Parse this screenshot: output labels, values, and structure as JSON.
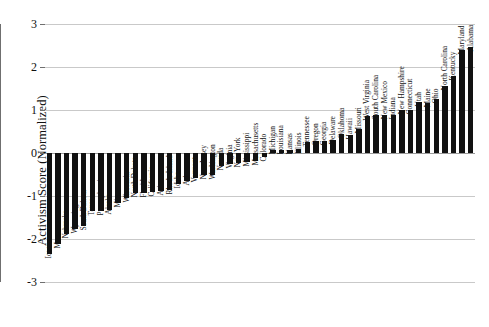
{
  "chart_data": {
    "type": "bar",
    "title": "",
    "subtitle": "",
    "xlabel": "",
    "ylabel": "Activism Score (Normalized)",
    "ylim": [
      -3,
      3
    ],
    "yticks": [
      3,
      2,
      1,
      0,
      -1,
      -2,
      -3
    ],
    "ytick_labels": [
      "3",
      "2",
      "1",
      "0",
      "-1",
      "-2",
      "-3"
    ],
    "grid": true,
    "legend": "none",
    "bar_color": "#111111",
    "orientation": "vertical",
    "sorted": "ascending",
    "categories": [
      "Iowa",
      "Montana",
      "Nebraska",
      "Wyoming",
      "South Dakota",
      "Texas",
      "Pennsylvania",
      "Alaska",
      "Minnesota",
      "Wisconsin",
      "North Dakota",
      "Florida",
      "California",
      "Arizona",
      "Rhode Island",
      "Idaho",
      "Arkansas",
      "Vermont",
      "New Jersey",
      "Washington",
      "Nevada",
      "Virginia",
      "New York",
      "Mississippi",
      "Massachusetts",
      "Colorado",
      "Michigan",
      "Louisiana",
      "Kansas",
      "Illinois",
      "Tennessee",
      "Oregon",
      "Georgia",
      "Delaware",
      "Oklahoma",
      "Hawaii",
      "Missouri",
      "West Virginia",
      "South Carolina",
      "New Mexico",
      "Indiana",
      "New Hampshire",
      "Connecticut",
      "Utah",
      "Maine",
      "Ohio",
      "North Carolina",
      "Kentucky",
      "Maryland",
      "Alabama"
    ],
    "values": [
      -2.35,
      -2.12,
      -1.88,
      -1.76,
      -1.7,
      -1.36,
      -1.35,
      -1.32,
      -1.16,
      -1.04,
      -0.92,
      -0.92,
      -0.9,
      -0.88,
      -0.86,
      -0.72,
      -0.66,
      -0.58,
      -0.52,
      -0.5,
      -0.3,
      -0.26,
      -0.24,
      -0.22,
      -0.18,
      -0.1,
      0.07,
      0.07,
      0.08,
      0.1,
      0.26,
      0.28,
      0.28,
      0.3,
      0.44,
      0.42,
      0.56,
      0.86,
      0.88,
      0.88,
      0.88,
      1.0,
      1.0,
      1.18,
      1.16,
      1.26,
      1.56,
      1.8,
      2.4,
      2.46
    ]
  }
}
